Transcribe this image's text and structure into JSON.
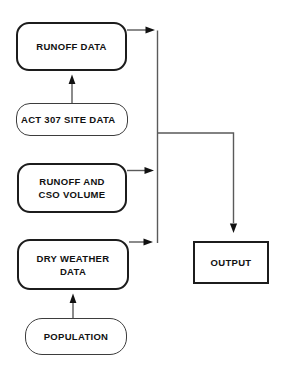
{
  "diagram": {
    "type": "flowchart",
    "colors": {
      "background": "#ffffff",
      "connector_line": "#5a5a5a",
      "arrowhead": "#111111",
      "box_border": "#1c1c1c",
      "text": "#111111"
    },
    "nodes": {
      "runoff_data": {
        "label": "RUNOFF DATA",
        "shape": "rounded-thick"
      },
      "act_307_site_data": {
        "label": "ACT 307 SITE DATA",
        "shape": "pill-thin"
      },
      "runoff_cso_volume": {
        "line1": "RUNOFF AND",
        "line2": "CSO VOLUME",
        "shape": "rounded-thick"
      },
      "dry_weather_data": {
        "line1": "DRY WEATHER",
        "line2": "DATA",
        "shape": "rounded-thick"
      },
      "population": {
        "label": "POPULATION",
        "shape": "pill-thin"
      },
      "output": {
        "label": "OUTPUT",
        "shape": "rectangle"
      }
    },
    "edges": [
      {
        "from": "act_307_site_data",
        "to": "runoff_data",
        "direction": "up"
      },
      {
        "from": "population",
        "to": "dry_weather_data",
        "direction": "up"
      },
      {
        "from": "runoff_data",
        "to": "collector-line",
        "direction": "right"
      },
      {
        "from": "runoff_cso_volume",
        "to": "collector-line",
        "direction": "right"
      },
      {
        "from": "dry_weather_data",
        "to": "collector-line",
        "direction": "right"
      },
      {
        "from": "collector-line",
        "to": "output",
        "direction": "down"
      }
    ]
  }
}
